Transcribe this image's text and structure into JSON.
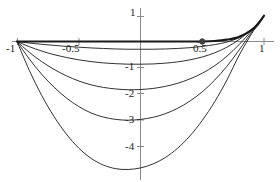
{
  "figure": {
    "title": "",
    "background_color": "#ffffff",
    "axis_color": "#808080",
    "curve_color": "#1a1a1a",
    "point_color": "#404040"
  },
  "axis_labels": {
    "x": [
      "-1",
      "-0.5",
      "0.5",
      "1"
    ],
    "y": [
      "1",
      "-1",
      "-2",
      "-3",
      "-4"
    ]
  },
  "marked_point": {
    "x": "0.5",
    "y": "0"
  },
  "chart_data": {
    "type": "line",
    "title": "",
    "xlabel": "",
    "ylabel": "",
    "xlim": [
      -1.1,
      1.1
    ],
    "ylim": [
      -5.1,
      1.2
    ],
    "grid": false,
    "legend": "none",
    "xticks": [
      -1,
      -0.5,
      0.5,
      1
    ],
    "xtick_labels": [
      "-1",
      "-0.5",
      "0.5",
      "1"
    ],
    "yticks": [
      1,
      -1,
      -2,
      -3,
      -4
    ],
    "ytick_labels": [
      "1",
      "-1",
      "-2",
      "-3",
      "-4"
    ],
    "axes_position": {
      "x_axis_at_y": 0,
      "y_axis_at_x": 0
    },
    "annotations": [
      {
        "type": "point",
        "x": 0.5,
        "y": 0,
        "marker": "filled-circle",
        "size": 6
      }
    ],
    "series": [
      {
        "name": "c0 (thick baseline, y=0 then rising to 1)",
        "linewidth": 2.2,
        "x": [
          -1.0,
          -0.8,
          -0.6,
          -0.4,
          -0.2,
          0.0,
          0.2,
          0.4,
          0.5,
          0.6,
          0.7,
          0.8,
          0.9,
          0.95,
          1.0
        ],
        "y": [
          0.0,
          0.0,
          0.0,
          0.0,
          0.0,
          0.0,
          0.0,
          0.0,
          0.0,
          0.02,
          0.07,
          0.18,
          0.44,
          0.66,
          1.0
        ]
      },
      {
        "name": "c1",
        "linewidth": 0.9,
        "x": [
          -1.0,
          -0.9,
          -0.8,
          -0.7,
          -0.6,
          -0.5,
          -0.4,
          -0.3,
          -0.2,
          -0.1,
          0.0,
          0.1,
          0.2,
          0.3,
          0.4,
          0.5,
          0.6,
          0.7,
          0.8,
          0.9,
          0.95,
          1.0
        ],
        "y": [
          0.0,
          -0.06,
          -0.11,
          -0.15,
          -0.19,
          -0.22,
          -0.25,
          -0.27,
          -0.29,
          -0.3,
          -0.3,
          -0.3,
          -0.29,
          -0.27,
          -0.24,
          -0.19,
          -0.12,
          -0.02,
          0.16,
          0.48,
          0.7,
          1.0
        ]
      },
      {
        "name": "c2",
        "linewidth": 0.9,
        "x": [
          -1.0,
          -0.9,
          -0.8,
          -0.7,
          -0.6,
          -0.5,
          -0.4,
          -0.3,
          -0.2,
          -0.1,
          0.0,
          0.1,
          0.2,
          0.3,
          0.4,
          0.5,
          0.6,
          0.7,
          0.8,
          0.9,
          0.95,
          1.0
        ],
        "y": [
          0.0,
          -0.2,
          -0.37,
          -0.51,
          -0.62,
          -0.71,
          -0.78,
          -0.83,
          -0.86,
          -0.88,
          -0.88,
          -0.87,
          -0.84,
          -0.79,
          -0.71,
          -0.6,
          -0.44,
          -0.22,
          0.08,
          0.48,
          0.72,
          1.0
        ]
      },
      {
        "name": "c3",
        "linewidth": 0.9,
        "x": [
          -1.0,
          -0.9,
          -0.8,
          -0.7,
          -0.6,
          -0.5,
          -0.4,
          -0.3,
          -0.2,
          -0.1,
          0.0,
          0.1,
          0.2,
          0.3,
          0.4,
          0.5,
          0.6,
          0.7,
          0.8,
          0.9,
          0.95,
          1.0
        ],
        "y": [
          0.0,
          -0.42,
          -0.78,
          -1.08,
          -1.33,
          -1.53,
          -1.68,
          -1.78,
          -1.84,
          -1.87,
          -1.86,
          -1.82,
          -1.74,
          -1.62,
          -1.45,
          -1.23,
          -0.94,
          -0.57,
          -0.11,
          0.42,
          0.7,
          1.0
        ]
      },
      {
        "name": "c4",
        "linewidth": 0.9,
        "x": [
          -1.0,
          -0.9,
          -0.8,
          -0.7,
          -0.6,
          -0.5,
          -0.4,
          -0.3,
          -0.2,
          -0.1,
          0.0,
          0.1,
          0.2,
          0.3,
          0.4,
          0.5,
          0.6,
          0.7,
          0.8,
          0.9,
          0.95,
          1.0
        ],
        "y": [
          0.0,
          -0.68,
          -1.27,
          -1.77,
          -2.19,
          -2.52,
          -2.77,
          -2.93,
          -3.02,
          -3.05,
          -3.02,
          -2.94,
          -2.8,
          -2.59,
          -2.31,
          -1.95,
          -1.5,
          -0.96,
          -0.32,
          0.36,
          0.69,
          1.0
        ]
      },
      {
        "name": "c5",
        "linewidth": 0.9,
        "x": [
          -1.0,
          -0.9,
          -0.8,
          -0.7,
          -0.6,
          -0.5,
          -0.4,
          -0.3,
          -0.2,
          -0.1,
          0.0,
          0.1,
          0.2,
          0.3,
          0.4,
          0.5,
          0.6,
          0.7,
          0.8,
          0.9,
          0.95,
          1.0
        ],
        "y": [
          0.0,
          -1.12,
          -2.09,
          -2.91,
          -3.59,
          -4.13,
          -4.53,
          -4.79,
          -4.93,
          -4.96,
          -4.9,
          -4.75,
          -4.5,
          -4.14,
          -3.66,
          -3.06,
          -2.34,
          -1.49,
          -0.52,
          0.3,
          0.66,
          1.0
        ]
      }
    ]
  }
}
